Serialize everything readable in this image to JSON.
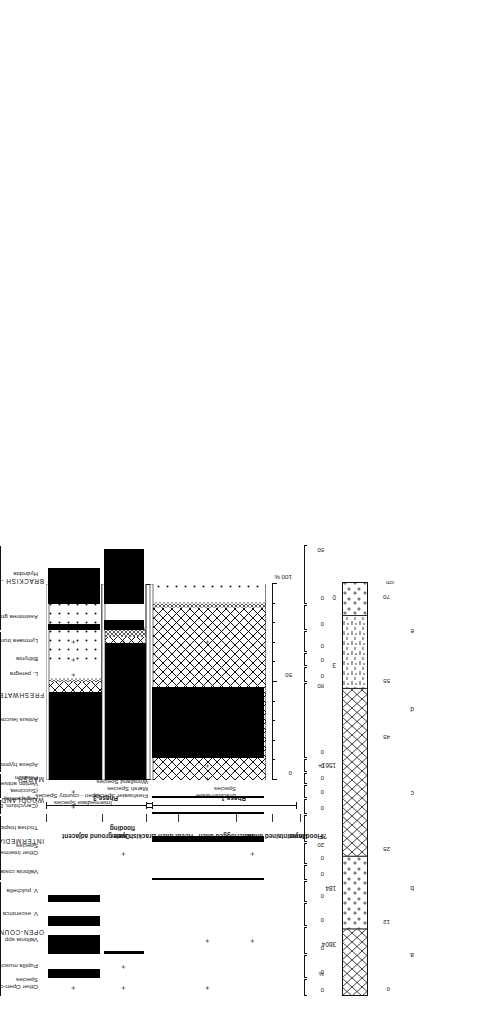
{
  "figure": {
    "axis_percent_symbol": "%",
    "cm_label": "cm"
  },
  "cumulative": {
    "title": "",
    "axis": {
      "ticks": [
        "0",
        "50",
        "100 %"
      ],
      "min": 0,
      "max": 100
    },
    "legend_labels": [
      "Brackish-water\nSpecies",
      "Freshwater Species",
      "Marsh Species",
      "Woodland  Species",
      "Intermediate Species",
      "Open - country Species"
    ],
    "legend_lines": [
      "Brackish-water",
      "Species",
      "Freshwater Species",
      "Marsh Species",
      "Woodland  Species",
      "Intermediate Species",
      "Open - country Species"
    ]
  },
  "phases": {
    "phase3": "Phase 3",
    "phase1": "Phase 1"
  },
  "contexts": [
    {
      "key": "a",
      "label": "Open ground adjacent"
    },
    {
      "key": "b",
      "label": "Brackish water\nflooding"
    },
    {
      "key": "c",
      "label": "Recut  ditch"
    },
    {
      "key": "d",
      "label": "Waterlogged ditch"
    },
    {
      "key": "e",
      "label": "Unmaintained ditch"
    },
    {
      "key": "f",
      "label": "?Flood layer"
    }
  ],
  "context_labels_flat": [
    "Open ground adjacent",
    "Brackish water flooding",
    "Recut  ditch",
    "Waterlogged ditch",
    "Unmaintained ditch",
    "?Flood layer"
  ],
  "ecological_groups": [
    {
      "name": "BRACKISH - WATER"
    },
    {
      "name": "FRESHWATER/SLUM"
    },
    {
      "name": "MARSH"
    },
    {
      "name": "WOODLAND"
    },
    {
      "name": "INTERMEDIATE"
    },
    {
      "name": "OPEN-COUNTRY"
    }
  ],
  "column": {
    "depth_ticks": [
      "0",
      "12",
      "25",
      "45",
      "55",
      "70"
    ],
    "section_letters": [
      "a",
      "b",
      "c",
      "d",
      "e"
    ],
    "counts": [
      "3604",
      "184",
      "1561+",
      "3",
      "0"
    ],
    "count_label_note": ""
  },
  "chart_data": {
    "type": "bar",
    "xlabel": "%",
    "ylabel": "",
    "orientation": "horizontal-rotated",
    "grid": false,
    "legend": "none",
    "samples": [
      {
        "key": "a",
        "label": "Open ground adjacent",
        "count": "3604",
        "phase": "Phase 3"
      },
      {
        "key": "b",
        "label": "Brackish water flooding",
        "count": "184",
        "phase": "Phase 3"
      },
      {
        "key": "c",
        "label": "Recut  ditch",
        "count": "1561+",
        "phase": "Phase 1"
      },
      {
        "key": "d",
        "label": "Waterlogged ditch",
        "count": "3",
        "phase": "Phase 1"
      },
      {
        "key": "e",
        "label": "Unmaintained ditch",
        "count": "0",
        "phase": "Phase 1"
      }
    ],
    "axis_ticks_per_taxon": [
      "0",
      "20",
      "40",
      "60",
      "80"
    ],
    "taxa": [
      {
        "name": "Hydrobia",
        "group": "BRACKISH - WATER",
        "axis_max": 60,
        "axis_labels": [
          "0",
          "50"
        ],
        "values": {
          "a": 37,
          "b": 57,
          "c": 0,
          "d": 0,
          "e": 0
        }
      },
      {
        "name": "Assiminea grayana",
        "group": "BRACKISH - WATER",
        "axis_max": 30,
        "axis_labels": [
          "0"
        ],
        "values": {
          "a": 8,
          "b": 13,
          "c": 0,
          "d": 0,
          "e": 0
        }
      },
      {
        "name": "Lymnaea truncatula",
        "group": "FRESHWATER/SLUM",
        "axis_max": 30,
        "axis_labels": [
          "0"
        ],
        "values": {
          "a": "+",
          "b": "+",
          "c": "+",
          "d": 0,
          "e": 0
        }
      },
      {
        "name": "Bithynia",
        "group": "FRESHWATER/SLUM",
        "axis_max": 30,
        "axis_labels": [
          "0"
        ],
        "values": {
          "a": "+",
          "b": 0,
          "c": 0,
          "d": 0,
          "e": 0
        }
      },
      {
        "name": "L. peregra",
        "group": "FRESHWATER/SLUM",
        "axis_max": 30,
        "axis_labels": [
          "0"
        ],
        "values": {
          "a": "+",
          "b": 0,
          "c": 0,
          "d": 0,
          "e": 0
        }
      },
      {
        "name": "Anisus leucostoma",
        "group": "FRESHWATER/SLUM",
        "axis_max": 90,
        "axis_labels": [
          "0",
          "80"
        ],
        "values": {
          "a": 0,
          "b": 0,
          "c": 86,
          "d": 0,
          "e": 0
        }
      },
      {
        "name": "Aplexa hypnorum",
        "group": "FRESHWATER/SLUM",
        "axis_max": 30,
        "axis_labels": [
          "0"
        ],
        "values": {
          "a": 0,
          "b": 0,
          "c": "+",
          "d": 0,
          "e": 0
        }
      },
      {
        "name": "Pisidium",
        "group": "MARSH",
        "axis_max": 30,
        "axis_labels": [
          "0"
        ],
        "values": {
          "a": 0,
          "b": 0,
          "c": "+",
          "d": 0,
          "e": 0
        }
      },
      {
        "name": "(Succinea,\nVertigo antivertigo)",
        "group": "MARSH",
        "axis_max": 30,
        "axis_labels": [
          "0"
        ],
        "values": {
          "a": "+",
          "b": 0,
          "c": 4,
          "d": 0,
          "e": 0
        }
      },
      {
        "name": "(Carychium, Discus,\nAegopinella)",
        "group": "WOODLAND",
        "axis_max": 30,
        "axis_labels": [
          "0"
        ],
        "values": {
          "a": "+",
          "b": 0,
          "c": 3,
          "d": 0,
          "e": 0
        }
      },
      {
        "name": "Trichea hispida",
        "group": "INTERMEDIATE",
        "axis_max": 30,
        "axis_labels": [
          "0"
        ],
        "values": {
          "a": 0,
          "b": 0,
          "c": 7,
          "d": 0,
          "e": 0
        }
      },
      {
        "name": "Other Intermediate\nSpecies",
        "group": "INTERMEDIATE",
        "axis_max": 30,
        "axis_labels": [
          "0",
          "20"
        ],
        "values": {
          "a": 0,
          "b": "+",
          "c": 0,
          "d": "+",
          "e": 0
        }
      },
      {
        "name": "Vallonia costata",
        "group": "INTERMEDIATE",
        "axis_max": 30,
        "axis_labels": [
          "0"
        ],
        "values": {
          "a": 0,
          "b": 0,
          "c": 2,
          "d": 0,
          "e": 0
        }
      },
      {
        "name": "V. pulchella",
        "group": "OPEN-COUNTRY",
        "axis_max": 30,
        "axis_labels": [
          "0"
        ],
        "values": {
          "a": 10,
          "b": 0,
          "c": 0,
          "d": 0,
          "e": 0
        }
      },
      {
        "name": "V. excentrica",
        "group": "OPEN-COUNTRY",
        "axis_max": 30,
        "axis_labels": [
          "0"
        ],
        "values": {
          "a": 14,
          "b": 0,
          "c": 0,
          "d": 0,
          "e": 0
        }
      },
      {
        "name": "Vallonia spp",
        "group": "OPEN-COUNTRY",
        "axis_max": 30,
        "axis_labels": [
          "0"
        ],
        "values": {
          "a": 22,
          "b": 4,
          "c": "+",
          "d": "+",
          "e": 0
        }
      },
      {
        "name": "Pupilla muscorum",
        "group": "OPEN-COUNTRY",
        "axis_max": 30,
        "axis_labels": [
          "0"
        ],
        "values": {
          "a": 12,
          "b": "+",
          "c": 0,
          "d": 0,
          "e": 0
        }
      },
      {
        "name": "Other Open-country\nSpecies",
        "group": "OPEN-COUNTRY",
        "axis_max": 30,
        "axis_labels": [
          "0",
          "%"
        ],
        "values": {
          "a": "+",
          "b": "+",
          "c": "+",
          "d": 0,
          "e": 0
        }
      }
    ],
    "cumulative_chart": {
      "type": "stacked-bar",
      "axis": [
        0,
        100
      ],
      "axis_labels": [
        "0",
        "50",
        "100 %"
      ],
      "categories": [
        "a",
        "b",
        "c"
      ],
      "series": [
        {
          "name": "Brackish-water Species",
          "fill": "solid-black",
          "values": {
            "a": 45,
            "b": 70,
            "c": 0
          }
        },
        {
          "name": "Freshwater Species",
          "fill": "cross-hatch",
          "values": {
            "a": 5,
            "b": 3,
            "c": 88
          }
        },
        {
          "name": "Marsh Species",
          "fill": "fine-hatch",
          "values": {
            "a": 1,
            "b": 4,
            "c": 2
          }
        },
        {
          "name": "Woodland Species",
          "fill": "line",
          "values": {
            "a": 1,
            "b": 1,
            "c": 1
          }
        },
        {
          "name": "Intermediate Species",
          "fill": "white",
          "values": {
            "a": 8,
            "b": 14,
            "c": 5
          }
        },
        {
          "name": "Open-country Species",
          "fill": "dots",
          "values": {
            "a": 40,
            "b": 8,
            "c": 4
          }
        }
      ]
    }
  }
}
